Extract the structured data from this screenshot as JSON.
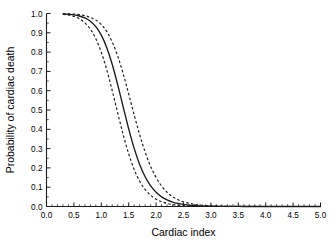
{
  "chart_data": {
    "type": "line",
    "title": "",
    "subtitle": "",
    "xlabel": "Cardiac index",
    "ylabel": "Probability of cardiac death",
    "xlim": [
      0.0,
      5.0
    ],
    "ylim": [
      0.0,
      1.0
    ],
    "grid": false,
    "legend": null,
    "legend_position": "none",
    "annotations": [],
    "background_color": "#ffffff",
    "line_color": "#1a1a1a",
    "xticks": [
      0.0,
      0.5,
      1.0,
      1.5,
      2.0,
      2.5,
      3.0,
      3.5,
      4.0,
      4.5,
      5.0
    ],
    "xtick_labels": [
      "0.0",
      "0.5",
      "1.0",
      "1.5",
      "2.0",
      "2.5",
      "3.0",
      "3.5",
      "4.0",
      "4.5",
      "5.0"
    ],
    "xminor_step": 0.1,
    "yticks": [
      0.0,
      0.1,
      0.2,
      0.3,
      0.4,
      0.5,
      0.6,
      0.7,
      0.8,
      0.9,
      1.0
    ],
    "ytick_labels": [
      "0.0",
      "0.1",
      "0.2",
      "0.3",
      "0.4",
      "0.5",
      "0.6",
      "0.7",
      "0.8",
      "0.9",
      "1.0"
    ],
    "yminor_step": 0.05,
    "x": [
      0.3,
      0.4,
      0.5,
      0.6,
      0.7,
      0.8,
      0.9,
      1.0,
      1.1,
      1.2,
      1.3,
      1.4,
      1.5,
      1.6,
      1.7,
      1.8,
      1.9,
      2.0,
      2.1,
      2.2,
      2.3,
      2.4,
      2.5,
      2.6,
      2.7,
      2.8,
      2.9,
      3.0,
      3.2,
      3.4,
      3.6,
      3.8,
      4.0,
      4.5,
      5.0
    ],
    "series": [
      {
        "name": "Fitted probability",
        "style": "solid",
        "values": [
          0.998,
          0.996,
          0.993,
          0.987,
          0.977,
          0.96,
          0.932,
          0.888,
          0.823,
          0.736,
          0.63,
          0.515,
          0.402,
          0.301,
          0.218,
          0.154,
          0.107,
          0.074,
          0.05,
          0.034,
          0.023,
          0.016,
          0.011,
          0.007,
          0.005,
          0.003,
          0.002,
          0.0015,
          0.0008,
          0.0004,
          0.0002,
          0.0001,
          0.0001,
          0.0,
          0.0
        ]
      },
      {
        "name": "Upper 95% confidence limit",
        "style": "dashed",
        "values": [
          0.999,
          0.998,
          0.997,
          0.994,
          0.989,
          0.98,
          0.966,
          0.943,
          0.906,
          0.852,
          0.779,
          0.687,
          0.583,
          0.475,
          0.372,
          0.282,
          0.208,
          0.15,
          0.106,
          0.074,
          0.051,
          0.035,
          0.024,
          0.017,
          0.011,
          0.008,
          0.005,
          0.004,
          0.002,
          0.001,
          0.0005,
          0.0003,
          0.0002,
          0.0001,
          0.0
        ]
      },
      {
        "name": "Lower 95% confidence limit",
        "style": "dashed",
        "values": [
          0.996,
          0.992,
          0.985,
          0.973,
          0.952,
          0.919,
          0.869,
          0.799,
          0.708,
          0.6,
          0.484,
          0.372,
          0.273,
          0.192,
          0.131,
          0.088,
          0.058,
          0.038,
          0.025,
          0.016,
          0.01,
          0.007,
          0.004,
          0.003,
          0.002,
          0.001,
          0.0007,
          0.0005,
          0.0002,
          0.0001,
          0.0001,
          0.0,
          0.0,
          0.0,
          0.0
        ]
      }
    ],
    "midpoint_x_at_p50": 1.23
  }
}
